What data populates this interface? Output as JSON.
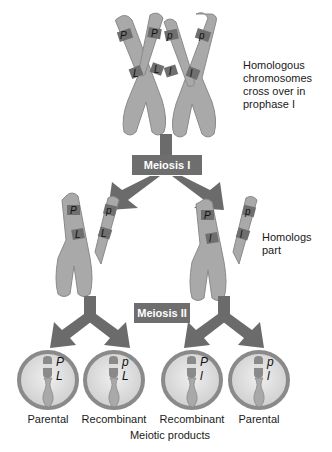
{
  "diagram": {
    "title_annotations": {
      "prophase": "Homologous\nchromosomes\ncross over in\nprophase I",
      "homologs_part": "Homologs\npart"
    },
    "stages": {
      "meiosis1": "Meiosis I",
      "meiosis2": "Meiosis II"
    },
    "top_chromosomes": {
      "left_homolog": {
        "upper_gene": "P",
        "lower_gene": "L"
      },
      "left_sister2": {
        "upper_gene": "P",
        "lower_gene": "L"
      },
      "right_sister1": {
        "upper_gene": "p",
        "lower_gene": "l"
      },
      "right_homolog": {
        "upper_gene": "p",
        "lower_gene": "l"
      }
    },
    "middle_chromosomes": {
      "left": {
        "genes_left": [
          "P",
          "L"
        ],
        "genes_right": [
          "p",
          "L"
        ]
      },
      "right": {
        "genes_left": [
          "P",
          "l"
        ],
        "genes_right": [
          "p",
          "l"
        ]
      }
    },
    "products": [
      {
        "gene1": "P",
        "gene2": "L",
        "label": "Parental"
      },
      {
        "gene1": "p",
        "gene2": "L",
        "label": "Recombinant"
      },
      {
        "gene1": "P",
        "gene2": "l",
        "label": "Recombinant"
      },
      {
        "gene1": "p",
        "gene2": "l",
        "label": "Parental"
      }
    ],
    "footer": "Meiotic products",
    "colors": {
      "chromosome": "#a9a9a9",
      "chromosome_band": "#6f6f6f",
      "outline": "#7a7a7a",
      "arrow": "#6b6b6b",
      "stage_box": "#6e6e6e",
      "cell_rim": "#8a8a8a",
      "cell_fill": "#dcdcdc"
    }
  }
}
